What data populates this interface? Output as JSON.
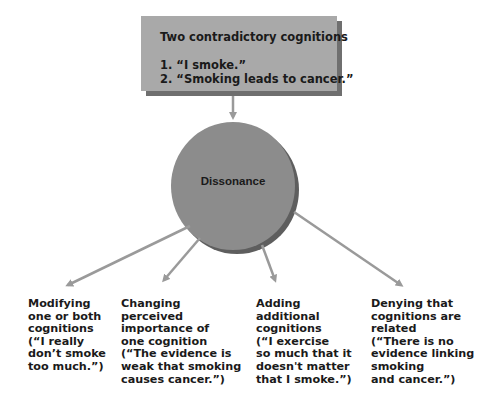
{
  "title_box": {
    "heading": "Two contradictory cognitions",
    "items": [
      "1. “I smoke.”",
      "2. “Smoking leads to cancer.”"
    ]
  },
  "center_node": {
    "label": "Dissonance"
  },
  "outcomes": [
    {
      "text": "Modifying\none or both\ncognitions\n(“I really\ndon’t smoke\ntoo much.”)"
    },
    {
      "text": "Changing\nperceived\nimportance of\none cognition\n(“The evidence is\nweak that smoking\ncauses cancer.”)"
    },
    {
      "text": "Adding\nadditional\ncognitions\n(“I exercise\nso much that it\ndoesn't matter\nthat I smoke.”)"
    },
    {
      "text": "Denying that\ncognitions are\nrelated\n(“There is no\nevidence linking\nsmoking\nand cancer.”)"
    }
  ],
  "colors": {
    "box_fill": "#a9a9a9",
    "box_shadow": "#6f6f6f",
    "circle_fill": "#8c8c8c",
    "circle_shadow": "#5e5e5e",
    "arrow": "#9a9a9a",
    "text": "#1a1a1a"
  }
}
